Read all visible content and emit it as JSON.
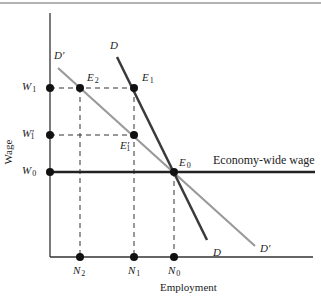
{
  "diagram": {
    "y_axis_label": "Wage",
    "x_axis_label": "Employment",
    "curves": {
      "D": {
        "label": "D",
        "label_end": "D",
        "color": "#3a3a3a"
      },
      "D_prime": {
        "label": "D",
        "prime": "′",
        "color": "#9a9a9a"
      },
      "economy_wide": {
        "label": "Economy-wide wage",
        "color": "#222222"
      }
    },
    "wage_levels": [
      {
        "id": "W1",
        "base": "W",
        "sub": "1",
        "prime": ""
      },
      {
        "id": "W1p",
        "base": "W",
        "sub": "1",
        "prime": "′"
      },
      {
        "id": "W0",
        "base": "W",
        "sub": "0",
        "prime": ""
      }
    ],
    "employment_levels": [
      {
        "id": "N2",
        "base": "N",
        "sub": "2"
      },
      {
        "id": "N1",
        "base": "N",
        "sub": "1"
      },
      {
        "id": "N0",
        "base": "N",
        "sub": "0"
      }
    ],
    "equilibria": [
      {
        "id": "E2",
        "base": "E",
        "sub": "2",
        "prime": ""
      },
      {
        "id": "E1",
        "base": "E",
        "sub": "1",
        "prime": ""
      },
      {
        "id": "E1p",
        "base": "E",
        "sub": "1",
        "prime": "′"
      },
      {
        "id": "E0",
        "base": "E",
        "sub": "0",
        "prime": ""
      }
    ]
  }
}
